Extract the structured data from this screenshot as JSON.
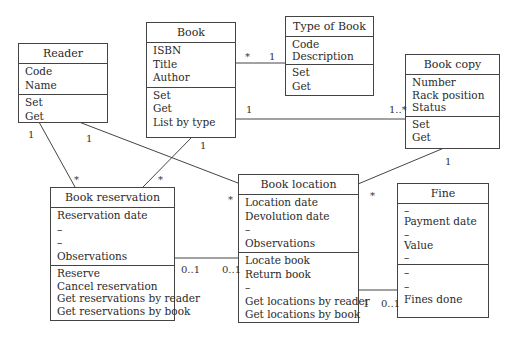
{
  "classes": [
    {
      "id": "reader",
      "name": "Reader",
      "attributes": [
        "Code",
        "Name"
      ],
      "operations": [
        "Set",
        "Get"
      ]
    },
    {
      "id": "book",
      "name": "Book",
      "attributes": [
        "ISBN",
        "Title",
        "Author"
      ],
      "operations": [
        "Set",
        "Get",
        "List by type"
      ]
    },
    {
      "id": "type_of_book",
      "name": "Type of Book",
      "attributes": [
        "Code",
        "Description"
      ],
      "operations": [
        "Set",
        "Get"
      ]
    },
    {
      "id": "book_copy",
      "name": "Book copy",
      "attributes": [
        "Number",
        "Rack position",
        "Status"
      ],
      "operations": [
        "Set",
        "Get"
      ]
    },
    {
      "id": "book_reservation",
      "name": "Book reservation",
      "attributes": [
        "Reservation date",
        "–",
        "–",
        "Observations"
      ],
      "operations": [
        "Reserve",
        "Cancel reservation",
        "Get reservations by reader",
        "Get reservations by book"
      ]
    },
    {
      "id": "book_location",
      "name": "Book location",
      "attributes": [
        "Location date",
        "Devolution date",
        "–",
        "Observations"
      ],
      "operations": [
        "Locate book",
        "Return book",
        "–",
        "Get locations by reader",
        "Get locations by book"
      ]
    },
    {
      "id": "fine",
      "name": "Fine",
      "attributes": [
        "–",
        "Payment date",
        "–",
        "Value",
        "–"
      ],
      "operations": [
        "–",
        "–",
        "Fines done"
      ]
    }
  ],
  "associations": [
    {
      "from": "Book",
      "to": "Type of Book",
      "from_mult": "*",
      "to_mult": "1"
    },
    {
      "from": "Book",
      "to": "Book copy",
      "from_mult": "1",
      "to_mult": "1..*"
    },
    {
      "from": "Reader",
      "to": "Book reservation",
      "from_mult": "1",
      "to_mult": "*"
    },
    {
      "from": "Reader",
      "to": "Book location",
      "from_mult": "1",
      "to_mult": "*"
    },
    {
      "from": "Book",
      "to": "Book reservation",
      "from_mult": "1",
      "to_mult": "*"
    },
    {
      "from": "Book copy",
      "to": "Book location",
      "from_mult": "1",
      "to_mult": "*"
    },
    {
      "from": "Book reservation",
      "to": "Book location",
      "from_mult": "0..1",
      "to_mult": "0..1"
    },
    {
      "from": "Book location",
      "to": "Fine",
      "from_mult": "1",
      "to_mult": "0..1"
    }
  ],
  "labels": {
    "book_type_book": "*",
    "book_type_type": "1",
    "book_copy_book": "1",
    "book_copy_copy": "1..*",
    "reader_res_reader": "1",
    "reader_res_res": "*",
    "reader_loc_reader": "1",
    "reader_loc_loc": "*",
    "book_res_book": "1",
    "book_res_res": "*",
    "copy_loc_copy": "1",
    "copy_loc_loc": "*",
    "res_loc_res": "0..1",
    "res_loc_loc": "0..1",
    "loc_fine_loc": "1",
    "loc_fine_fine": "0..1"
  }
}
